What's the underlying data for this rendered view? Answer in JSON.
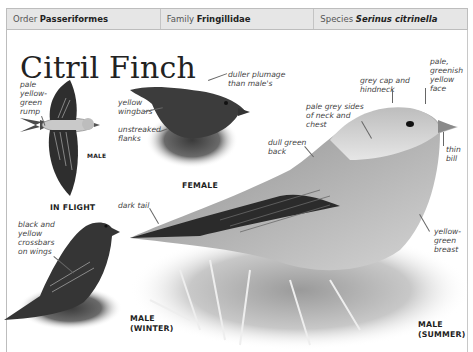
{
  "taxonomy": {
    "order_label": "Order",
    "order_value": "Passeriformes",
    "family_label": "Family",
    "family_value": "Fringillidae",
    "species_label": "Species",
    "species_value": "Serinus citrinella"
  },
  "title": "Citril Finch",
  "illustrations": {
    "in_flight": {
      "caption": "IN FLIGHT",
      "sex_label": "MALE",
      "annotations": [
        "pale\nyellow-\ngreen\nrump"
      ]
    },
    "female": {
      "caption": "FEMALE",
      "annotations": [
        "duller plumage\nthan male's",
        "yellow\nwingbars",
        "unstreaked\nflanks"
      ]
    },
    "male_winter": {
      "caption": "MALE\n(WINTER)",
      "annotations": [
        "black and\nyellow\ncrossbars\non wings"
      ]
    },
    "male_summer": {
      "caption": "MALE\n(SUMMER)",
      "annotations": [
        "dark tail",
        "dull green\nback",
        "pale grey sides\nof neck and\nchest",
        "grey cap and\nhindneck",
        "pale,\ngreenish\nyellow\nface",
        "thin\nbill",
        "yellow-\ngreen\nbreast"
      ]
    }
  }
}
